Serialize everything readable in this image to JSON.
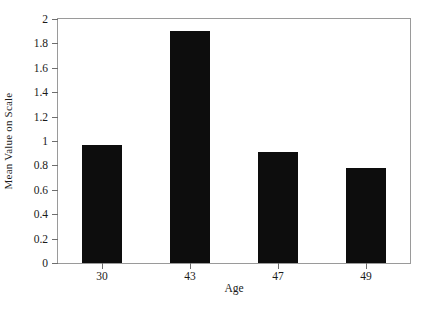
{
  "chart_data": {
    "type": "bar",
    "title": "",
    "subtitle": "",
    "categories": [
      "30",
      "43",
      "47",
      "49"
    ],
    "values": [
      0.97,
      1.9,
      0.91,
      0.78
    ],
    "xlabel": "Age",
    "ylabel": "Mean Value on Scale",
    "ylim": [
      0,
      2
    ],
    "ytick_labels": [
      "0",
      "0.2",
      "0.4",
      "0.6",
      "0.8",
      "1",
      "1.2",
      "1.4",
      "1.6",
      "1.8",
      "2"
    ],
    "ytick_values": [
      0,
      0.2,
      0.4,
      0.6,
      0.8,
      1,
      1.2,
      1.4,
      1.6,
      1.8,
      2
    ],
    "grid": false,
    "legend": null,
    "bar_color": "#0d0d0d",
    "frame_color": "#9a9a9a",
    "background": "#ffffff",
    "annotations": []
  },
  "axis": {
    "x_title": "Age",
    "y_title": "Mean Value on Scale"
  }
}
